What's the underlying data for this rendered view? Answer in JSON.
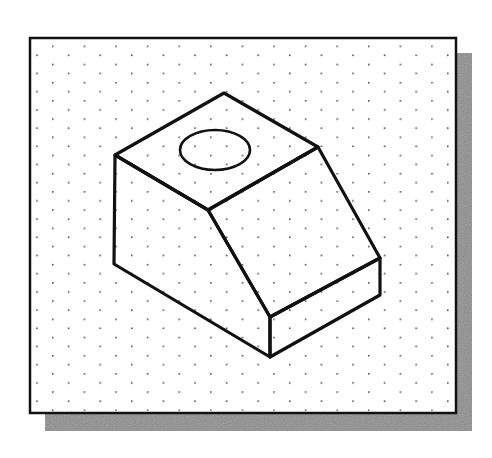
{
  "figure": {
    "colors": {
      "background": "#ffffff",
      "frame_fill": "#ffffff",
      "frame_stroke": "#111111",
      "shadow": "#8c8c8c",
      "grid_dot": "#555555",
      "object_stroke": "#111111"
    },
    "frame": {
      "x": 30,
      "y": 38,
      "width": 426,
      "height": 375
    },
    "shadow": {
      "x": 45,
      "y": 53,
      "width": 427,
      "height": 378
    },
    "grid": {
      "type": "isometric-dots",
      "dx": 31.6,
      "dy": 18.2,
      "origin_x": 52,
      "origin_y": 45.5
    },
    "object": {
      "vertices": {
        "top_back": [
          224,
          93
        ],
        "top_left": [
          115,
          155
        ],
        "top_right": [
          318,
          147
        ],
        "top_front": [
          208,
          210
        ],
        "bottom_left": [
          114,
          264
        ],
        "slope_bottom_front": [
          270,
          317
        ],
        "slope_bottom_right": [
          380,
          258
        ],
        "base_front_bottom": [
          270,
          357
        ],
        "base_right_bottom": [
          380,
          295
        ]
      },
      "hole": {
        "cx": 215,
        "cy": 150,
        "rx": 35,
        "ry": 20
      }
    }
  }
}
